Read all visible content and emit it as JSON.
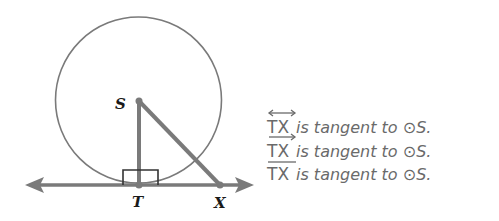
{
  "diagram": {
    "points": {
      "S": {
        "label": "S"
      },
      "T": {
        "label": "T"
      },
      "X": {
        "label": "X"
      }
    },
    "circle": {
      "name": "circle-S",
      "center": "S"
    },
    "colors": {
      "stroke": "#7a7a7a",
      "text": "#6a6a6a",
      "label": "#1a1a1a"
    }
  },
  "statements": [
    {
      "segment": "TX",
      "notation": "line",
      "text": " is tangent to ",
      "circle_symbol": "⊙",
      "circle_name": "S."
    },
    {
      "segment": "TX",
      "notation": "ray",
      "text": " is tangent to ",
      "circle_symbol": "⊙",
      "circle_name": "S."
    },
    {
      "segment": "TX",
      "notation": "segment",
      "text": " is tangent to ",
      "circle_symbol": "⊙",
      "circle_name": "S."
    }
  ]
}
